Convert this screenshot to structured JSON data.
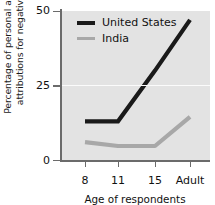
{
  "chart_data": {
    "type": "line",
    "title": "",
    "xlabel": "Age of respondents",
    "ylabel_line1": "Percentage of personal and situational",
    "ylabel_line2": "attributions for negative behaviors",
    "categories": [
      "8",
      "11",
      "15",
      "Adult"
    ],
    "yticks": [
      "0",
      "25",
      "50"
    ],
    "ylim": [
      0,
      50
    ],
    "grid": true,
    "legend_position": "top-left",
    "series": [
      {
        "name": "United States",
        "color": "#1a1a1a",
        "values": [
          13,
          13,
          30,
          47
        ]
      },
      {
        "name": "India",
        "color": "#a8a8a8",
        "values": [
          6,
          4.7,
          4.7,
          14.5
        ]
      }
    ]
  },
  "colors": {
    "plot_background": "#e3e3e3",
    "gridline": "#fbfbfb",
    "axis": "#6b6b6b",
    "united_states": "#1a1a1a",
    "india": "#a8a8a8"
  }
}
